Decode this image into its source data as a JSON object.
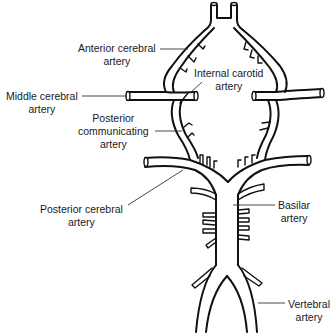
{
  "diagram": {
    "labels": [
      {
        "id": "anterior-cerebral-artery",
        "lines": [
          "Anterior cerebral",
          "artery"
        ]
      },
      {
        "id": "internal-carotid-artery",
        "lines": [
          "Internal carotid",
          "artery"
        ]
      },
      {
        "id": "middle-cerebral-artery",
        "lines": [
          "Middle cerebral",
          "artery"
        ]
      },
      {
        "id": "posterior-communicating-artery",
        "lines": [
          "Posterior",
          "communicating",
          "artery"
        ]
      },
      {
        "id": "posterior-cerebral-artery",
        "lines": [
          "Posterior cerebral",
          "artery"
        ]
      },
      {
        "id": "basilar-artery",
        "lines": [
          "Basilar",
          "artery"
        ]
      },
      {
        "id": "vertebral-artery",
        "lines": [
          "Vertebral",
          "artery"
        ]
      }
    ],
    "colors": {
      "line": "#111111",
      "background": "#ffffff",
      "text": "#1a1a1a"
    }
  }
}
